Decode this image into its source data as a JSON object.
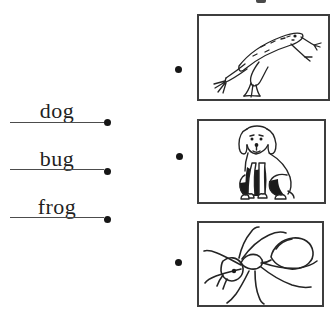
{
  "page": {
    "background": "#ffffff",
    "ink": "#1f1f1f",
    "accent": "#161616"
  },
  "matching": {
    "words": [
      {
        "label": "dog"
      },
      {
        "label": "bug"
      },
      {
        "label": "frog"
      }
    ],
    "pictures": [
      {
        "name": "frog"
      },
      {
        "name": "dog"
      },
      {
        "name": "ant"
      }
    ]
  }
}
